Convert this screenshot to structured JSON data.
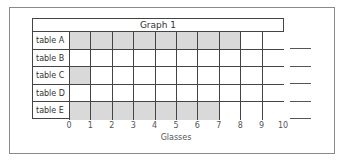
{
  "chart_data": {
    "type": "bar",
    "orientation": "horizontal",
    "title": "Graph 1",
    "xlabel": "Glasses",
    "ylabel": "",
    "categories": [
      "table A",
      "table B",
      "table C",
      "table D",
      "table E"
    ],
    "values": [
      8,
      0,
      1,
      0,
      7
    ],
    "x_ticks": [
      "0",
      "1",
      "2",
      "3",
      "4",
      "5",
      "6",
      "7",
      "8",
      "9",
      "10"
    ],
    "xlim": [
      0,
      10
    ],
    "grid": true,
    "fill_color": "#d9d9d9",
    "answer_blanks": 5
  }
}
